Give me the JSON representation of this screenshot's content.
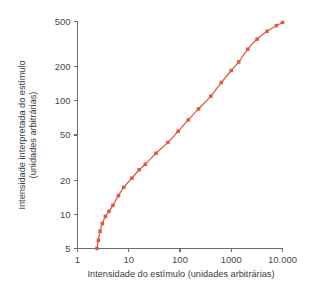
{
  "chart_data": {
    "type": "line",
    "title": "",
    "subtitle": "",
    "xlabel": "Intensidade do estímulo (unidades arbitrárias)",
    "ylabel": "Intensidade interpretada do estímulo (unidades arbitrárias)",
    "ylabel_line1": "Intensidade interpretada do estímulo",
    "ylabel_line2": "(unidades arbitrárias)",
    "xscale": "log",
    "yscale": "log",
    "xlim": [
      1,
      10000
    ],
    "ylim": [
      5,
      500
    ],
    "grid": false,
    "legend": false,
    "legend_position": "none",
    "series_color": "#e2583f",
    "marker": "square",
    "xticks": [
      1,
      10,
      100,
      1000,
      10000
    ],
    "xtick_labels": [
      "1",
      "10",
      "100",
      "1000",
      "10.000"
    ],
    "yticks": [
      5,
      10,
      20,
      50,
      100,
      200,
      500
    ],
    "ytick_labels": [
      "5",
      "10",
      "20",
      "50",
      "100",
      "200",
      "500"
    ],
    "series": [
      {
        "name": "resposta",
        "x": [
          2.4,
          2.55,
          2.75,
          3.05,
          3.5,
          4.1,
          4.9,
          6.3,
          8.0,
          11.5,
          16.0,
          21.0,
          34.0,
          58.0,
          92.0,
          145.0,
          230.0,
          400.0,
          640.0,
          1000.0,
          1400.0,
          2100.0,
          3200.0,
          5000.0,
          7600.0,
          10000.0
        ],
        "y": [
          5.0,
          5.9,
          7.1,
          8.3,
          9.6,
          10.6,
          12.0,
          14.6,
          17.3,
          20.8,
          24.7,
          27.6,
          34.5,
          43.0,
          54.0,
          68.0,
          85.0,
          110.0,
          145.0,
          185.0,
          220.0,
          285.0,
          350.0,
          410.0,
          460.0,
          490.0
        ]
      }
    ]
  },
  "figure": {
    "background_color": "#ffffff",
    "axis_color": "#6d6d6d",
    "text_color": "#3c3c3c"
  }
}
